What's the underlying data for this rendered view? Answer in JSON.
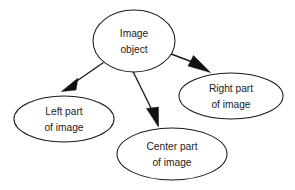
{
  "diagram": {
    "type": "node-link-graph",
    "canvas": {
      "width": 295,
      "height": 190,
      "background": "#ffffff"
    },
    "style": {
      "node_shape": "ellipse",
      "node_fill": "#ffffff",
      "node_stroke": "#1a1a1a",
      "edge_stroke": "#1a1a1a",
      "arrowhead": "filled-triangle",
      "text_color": "#222222"
    },
    "nodes": [
      {
        "id": "image-object",
        "line1": "Image",
        "line2": "object",
        "cx": 134,
        "cy": 41,
        "rx": 41,
        "ry": 31
      },
      {
        "id": "left-part",
        "line1": "Left part",
        "line2": "of image",
        "cx": 64,
        "cy": 119,
        "rx": 50,
        "ry": 23
      },
      {
        "id": "center-part",
        "line1": "Center part",
        "line2": "of image",
        "cx": 172,
        "cy": 154,
        "rx": 55,
        "ry": 26
      },
      {
        "id": "right-part",
        "line1": "Right part",
        "line2": "of image",
        "cx": 231,
        "cy": 96,
        "rx": 52,
        "ry": 23
      }
    ],
    "edges": [
      {
        "id": "edge-to-left",
        "from": "image-object",
        "to": "left-part",
        "direction": "down-left"
      },
      {
        "id": "edge-to-center",
        "from": "image-object",
        "to": "center-part",
        "direction": "down"
      },
      {
        "id": "edge-to-right",
        "from": "image-object",
        "to": "right-part",
        "direction": "down-right"
      }
    ]
  }
}
